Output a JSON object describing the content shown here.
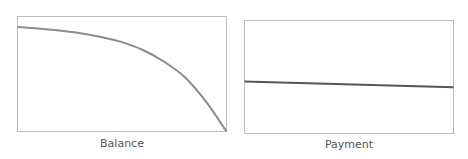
{
  "chart_data": [
    {
      "type": "line",
      "title": "",
      "xlabel": "Balance",
      "ylabel": "",
      "grid": false,
      "legend": null,
      "axis_ticks": "none",
      "description": "Declining balance over time, slow decline at start then accelerating to zero",
      "x": [
        0,
        0.1,
        0.2,
        0.3,
        0.4,
        0.5,
        0.6,
        0.7,
        0.8,
        0.9,
        1.0
      ],
      "values": [
        1.0,
        0.985,
        0.965,
        0.94,
        0.905,
        0.855,
        0.78,
        0.67,
        0.52,
        0.29,
        0.0
      ],
      "ylim": [
        0,
        1.1
      ],
      "line_color": "#8c8c8c"
    },
    {
      "type": "line",
      "title": "",
      "xlabel": "Payment",
      "ylabel": "",
      "grid": false,
      "legend": null,
      "axis_ticks": "none",
      "description": "Nearly constant payment, very slight decline",
      "x": [
        0,
        1.0
      ],
      "values": [
        0.46,
        0.41
      ],
      "ylim": [
        0,
        1.0
      ],
      "line_color": "#555555"
    }
  ],
  "panels": {
    "left": {
      "label": "Balance"
    },
    "right": {
      "label": "Payment"
    }
  },
  "colors": {
    "frame": "#bdbdbd",
    "balance_line": "#8c8c8c",
    "payment_line": "#555555",
    "label_text": "#555555"
  }
}
